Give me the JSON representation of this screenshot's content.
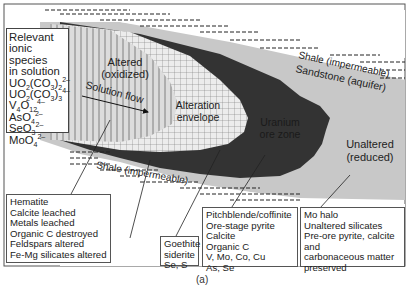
{
  "figure": {
    "caption": "(a)",
    "colors": {
      "unaltered_sandstone": "#c8c8c8",
      "ore_zone": "#333333",
      "alteration_envelope": "#e6e6e6",
      "altered_oxidized": "#dcdcdc",
      "shale": "#ffffff",
      "grid_lines": "#666666"
    },
    "zones": {
      "altered_line1": "Altered",
      "altered_line2": "(oxidized)",
      "solution_flow": "Solution flow",
      "alteration_line1": "Alteration",
      "alteration_line2": "envelope",
      "ore_line1": "Uranium",
      "ore_line2": "ore zone",
      "unaltered_line1": "Unaltered",
      "unaltered_line2": "(reduced)",
      "shale_top": "Shale (impermeable)",
      "sandstone": "Sandstone (aquifer)",
      "shale_bottom": "Shale (impermeable)"
    },
    "species_box": {
      "title_lines": [
        "Relevant",
        "ionic",
        "species",
        "in solution"
      ],
      "species": [
        {
          "base": "UO",
          "sub1": "2",
          "mid": "(CO",
          "sub2": "3",
          "end": ")",
          "sub3": "2",
          "charge": "2–"
        },
        {
          "base": "UO",
          "sub1": "2",
          "mid": "(CO",
          "sub2": "3",
          "end": ")",
          "sub3": "3",
          "charge": "4–"
        },
        {
          "base": "V",
          "sub1": "4",
          "mid": "O",
          "sub2": "12",
          "charge": "4–"
        },
        {
          "base": "AsO",
          "sub1": "4",
          "charge": "2–"
        },
        {
          "base": "SeO",
          "sub1": "3",
          "charge": "2–"
        },
        {
          "base": "MoO",
          "sub1": "4",
          "charge": "2–"
        }
      ]
    },
    "boxes": {
      "altered": [
        "Hematite",
        "Calcite leached",
        "Metals leached",
        "Organic C destroyed",
        "Feldspars altered",
        "Fe-Mg silicates altered"
      ],
      "goethite": [
        "Goethite",
        "siderite",
        "Se, S"
      ],
      "ore": [
        "Pitchblende/coffinite",
        "Ore-stage pyrite",
        "Calcite",
        "Organic C",
        "V, Mo, Co, Cu",
        "As, Se"
      ],
      "unaltered": [
        "Mo halo",
        "Unaltered silicates",
        "Pre-ore pyrite, calcite",
        "and",
        "carbonaceous matter",
        "preserved"
      ]
    }
  }
}
